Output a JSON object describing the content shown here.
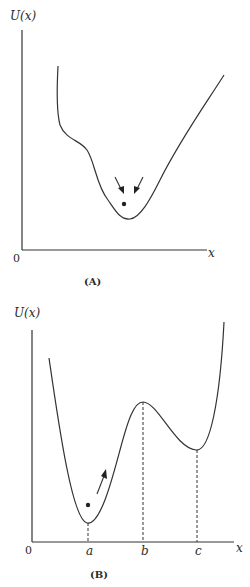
{
  "panel_a": {
    "y_axis_label": "U(x)",
    "x_axis_label": "x",
    "origin_label": "0",
    "caption": "(A)",
    "description": "Single potential well with a particle at the minimum; two arrows point inward toward the equilibrium"
  },
  "panel_b": {
    "y_axis_label": "U(x)",
    "x_axis_label": "x",
    "origin_label": "0",
    "caption": "(B)",
    "tick_labels": [
      "a",
      "b",
      "c"
    ],
    "description": "Double-well potential: global minimum at a, local maximum at b, local minimum at c; particle near a with arrow pointing up the slope"
  }
}
